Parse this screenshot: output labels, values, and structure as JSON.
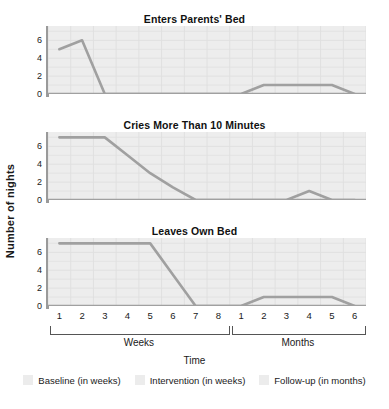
{
  "figure": {
    "y_axis_title": "Number of nights",
    "x_axis_title": "Time",
    "y_ticks": [
      "6",
      "4",
      "2",
      "0"
    ],
    "week_ticks": [
      "1",
      "2",
      "3",
      "4",
      "5",
      "6",
      "7",
      "8"
    ],
    "month_ticks": [
      "1",
      "2",
      "3",
      "4",
      "5",
      "6"
    ],
    "bracket_weeks": "Weeks",
    "bracket_months": "Months"
  },
  "legend": {
    "items": [
      {
        "label": "Baseline (in weeks)",
        "color": "#ececec"
      },
      {
        "label": "Intervention (in weeks)",
        "color": "#ececec"
      },
      {
        "label": "Follow-up (in months)",
        "color": "#ececec"
      }
    ]
  },
  "colors": {
    "line": "#a0a0a0",
    "plot_background": "#ededed",
    "grid": "#e0e0e0",
    "axis": "#9a9a9a",
    "text": "#1a1a1a"
  },
  "panels": [
    {
      "title": "Enters Parents' Bed"
    },
    {
      "title": "Cries More Than 10 Minutes"
    },
    {
      "title": "Leaves Own Bed"
    }
  ],
  "chart_data": {
    "type": "line",
    "xlabel": "Time",
    "ylabel": "Number of nights",
    "ylim": [
      0,
      7.6
    ],
    "yticks": [
      0,
      2,
      4,
      6
    ],
    "grid": true,
    "legend_position": "bottom-center",
    "x_segments": [
      {
        "name": "Weeks",
        "labels": [
          "1",
          "2",
          "3",
          "4",
          "5",
          "6",
          "7",
          "8"
        ]
      },
      {
        "name": "Months",
        "labels": [
          "1",
          "2",
          "3",
          "4",
          "5",
          "6"
        ]
      }
    ],
    "phases": [
      "Baseline (in weeks)",
      "Intervention (in weeks)",
      "Follow-up (in months)"
    ],
    "x": [
      "W1",
      "W2",
      "W3",
      "W4",
      "W5",
      "W6",
      "W7",
      "W8",
      "M1",
      "M2",
      "M3",
      "M4",
      "M5",
      "M6"
    ],
    "series": [
      {
        "name": "Enters Parents' Bed",
        "values": [
          5,
          6,
          0,
          0,
          0,
          0,
          0,
          0,
          0,
          1,
          1,
          1,
          1,
          0
        ]
      },
      {
        "name": "Cries More Than 10 Minutes",
        "values": [
          7,
          7,
          7,
          5,
          3,
          1.4,
          0,
          0,
          0,
          0,
          0,
          1,
          0,
          0
        ]
      },
      {
        "name": "Leaves Own Bed",
        "values": [
          7,
          7,
          7,
          7,
          7,
          3.5,
          0,
          0,
          0,
          1,
          1,
          1,
          1,
          0
        ]
      }
    ]
  }
}
